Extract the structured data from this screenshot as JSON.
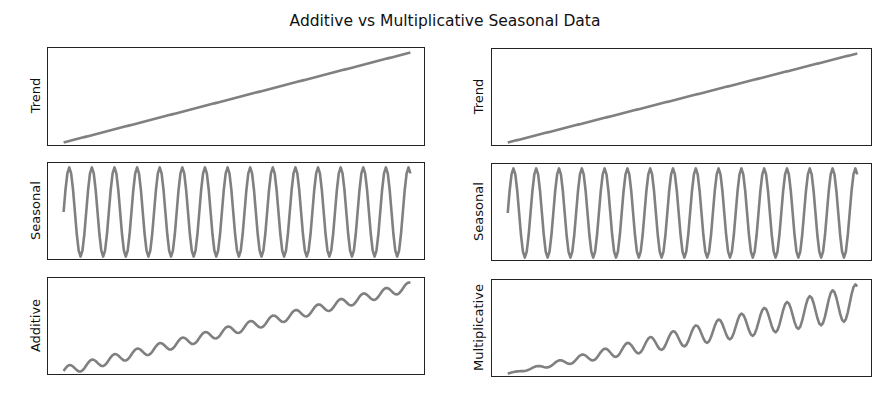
{
  "title": "Additive vs Multiplicative Seasonal Data",
  "style": {
    "line_color": "#808080",
    "frame_color": "#222222"
  },
  "panels": [
    {
      "id": "trend-left",
      "ylabel": "Trend",
      "series": "trend"
    },
    {
      "id": "seasonal-left",
      "ylabel": "Seasonal",
      "series": "seasonal"
    },
    {
      "id": "additive",
      "ylabel": "Additive",
      "series": "additive"
    },
    {
      "id": "trend-right",
      "ylabel": "Trend",
      "series": "trend"
    },
    {
      "id": "seasonal-right",
      "ylabel": "Seasonal",
      "series": "seasonal"
    },
    {
      "id": "multiplicative",
      "ylabel": "Multiplicative",
      "series": "multiplicative"
    }
  ],
  "chart_data": {
    "type": "line",
    "title": "Additive vs Multiplicative Seasonal Data",
    "layout": "3 rows x 2 columns, no ticks, no grid, no legend",
    "x": {
      "start": 0,
      "end": 184,
      "step": 1,
      "label": ""
    },
    "components": {
      "trend": {
        "formula": "t",
        "range": [
          0,
          184
        ]
      },
      "seasonal": {
        "formula": "sin(2*pi*t/12)",
        "period": 12,
        "range": [
          -1,
          1
        ]
      },
      "additive": {
        "formula": "trend + 10*seasonal",
        "amplitude": 10
      },
      "multiplicative": {
        "formula": "trend * (1 + 0.25*seasonal)",
        "amplitude_ratio": 0.25
      }
    },
    "subplots": [
      {
        "position": "row1-left",
        "ylabel": "Trend",
        "series": "trend"
      },
      {
        "position": "row2-left",
        "ylabel": "Seasonal",
        "series": "seasonal"
      },
      {
        "position": "row3-left",
        "ylabel": "Additive",
        "series": "additive"
      },
      {
        "position": "row1-right",
        "ylabel": "Trend",
        "series": "trend"
      },
      {
        "position": "row2-right",
        "ylabel": "Seasonal",
        "series": "seasonal"
      },
      {
        "position": "row3-right",
        "ylabel": "Multiplicative",
        "series": "multiplicative"
      }
    ]
  }
}
